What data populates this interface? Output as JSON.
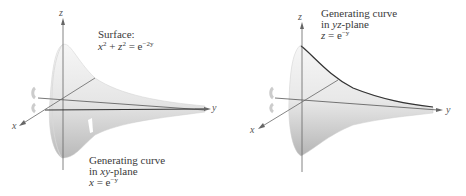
{
  "left_panel": {
    "axes": {
      "z": "z",
      "y": "y",
      "x": "x"
    },
    "surface_label": "Surface:",
    "surface_equation": {
      "lhs_x": "x",
      "lhs_x_exp": "2",
      "plus": " + ",
      "lhs_z": "z",
      "lhs_z_exp": "2",
      "eq": " = e",
      "rhs_exp": "−2y"
    },
    "curve_label_line1": "Generating curve",
    "curve_label_line2_prefix": "in ",
    "curve_label_line2_plane": "xy",
    "curve_label_line2_suffix": "-plane",
    "curve_equation": {
      "lhs": "x",
      "eq": " = e",
      "exp": "−y"
    }
  },
  "right_panel": {
    "axes": {
      "z": "z",
      "y": "y",
      "x": "x"
    },
    "curve_label_line1": "Generating curve",
    "curve_label_line2_prefix": "in ",
    "curve_label_line2_plane": "yz",
    "curve_label_line2_suffix": "-plane",
    "curve_equation": {
      "lhs": "z",
      "eq": " = e",
      "exp": "−y"
    }
  },
  "colors": {
    "surface_light": "#f4f4f4",
    "surface_dark": "#bdbdbd",
    "axis": "#666666",
    "curve": "#444444"
  }
}
